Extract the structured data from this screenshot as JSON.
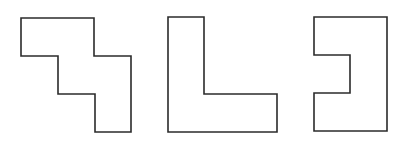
{
  "diagram": {
    "stroke_color": "#2b2b2b",
    "background": "#ffffff",
    "shapes": [
      {
        "id": "staircase-shape",
        "label": "",
        "points": "21,18 94,18 94,56 131,56 131,132 95,132 95,94 58,94 58,56 21,56"
      },
      {
        "id": "l-shape",
        "label": "",
        "points": "168,17 204,17 204,94 277,94 277,132 168,132"
      },
      {
        "id": "notched-rectangle-shape",
        "label": "",
        "points": "314,17 387,17 387,131 314,131 314,93 350,93 350,55 314,55"
      }
    ]
  }
}
